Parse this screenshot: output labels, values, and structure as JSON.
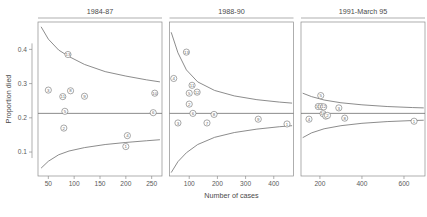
{
  "figure": {
    "xlabel": "Number of cases",
    "ylabel": "Proportion died"
  },
  "chart_data": {
    "type": "scatter",
    "title": "",
    "xlabel": "Number of cases",
    "ylabel": "Proportion died",
    "grid": false,
    "legend": "none",
    "reference_line": 0.213,
    "ylim": [
      0.03,
      0.48
    ],
    "yticks": [
      0.1,
      0.2,
      0.3,
      0.4
    ],
    "ytick_labels": [
      "0.1",
      "0.2",
      "0.3",
      "0.4"
    ],
    "panels": [
      {
        "title": "1984-87",
        "xlim": [
          30,
          270
        ],
        "xticks": [
          50,
          100,
          150,
          200,
          250
        ],
        "xtick_labels": [
          "50",
          "100",
          "150",
          "200",
          "250"
        ],
        "points": [
          {
            "label": "13",
            "x": 88,
            "y": 0.385
          },
          {
            "label": "3",
            "x": 50,
            "y": 0.281
          },
          {
            "label": "8",
            "x": 93,
            "y": 0.279
          },
          {
            "label": "11",
            "x": 78,
            "y": 0.262
          },
          {
            "label": "9",
            "x": 120,
            "y": 0.263
          },
          {
            "label": "5",
            "x": 82,
            "y": 0.219
          },
          {
            "label": "6",
            "x": 253,
            "y": 0.215
          },
          {
            "label": "10",
            "x": 256,
            "y": 0.272
          },
          {
            "label": "2",
            "x": 80,
            "y": 0.17
          },
          {
            "label": "4",
            "x": 203,
            "y": 0.148
          },
          {
            "label": "1",
            "x": 200,
            "y": 0.116
          }
        ],
        "upper_curve": [
          {
            "x": 36,
            "y": 0.466
          },
          {
            "x": 50,
            "y": 0.43
          },
          {
            "x": 70,
            "y": 0.398
          },
          {
            "x": 90,
            "y": 0.379
          },
          {
            "x": 120,
            "y": 0.356
          },
          {
            "x": 160,
            "y": 0.335
          },
          {
            "x": 200,
            "y": 0.322
          },
          {
            "x": 240,
            "y": 0.311
          },
          {
            "x": 266,
            "y": 0.305
          }
        ],
        "lower_curve": [
          {
            "x": 36,
            "y": 0.053
          },
          {
            "x": 50,
            "y": 0.073
          },
          {
            "x": 70,
            "y": 0.092
          },
          {
            "x": 90,
            "y": 0.103
          },
          {
            "x": 120,
            "y": 0.113
          },
          {
            "x": 160,
            "y": 0.122
          },
          {
            "x": 200,
            "y": 0.128
          },
          {
            "x": 240,
            "y": 0.133
          },
          {
            "x": 266,
            "y": 0.136
          }
        ]
      },
      {
        "title": "1988-90",
        "xlim": [
          30,
          470
        ],
        "xticks": [
          100,
          200,
          300,
          400
        ],
        "xtick_labels": [
          "100",
          "200",
          "300",
          "400"
        ],
        "points": [
          {
            "label": "13",
            "x": 90,
            "y": 0.392
          },
          {
            "label": "4",
            "x": 45,
            "y": 0.315
          },
          {
            "label": "11",
            "x": 110,
            "y": 0.295
          },
          {
            "label": "5",
            "x": 100,
            "y": 0.272
          },
          {
            "label": "12",
            "x": 128,
            "y": 0.275
          },
          {
            "label": "2",
            "x": 100,
            "y": 0.24
          },
          {
            "label": "6",
            "x": 113,
            "y": 0.213
          },
          {
            "label": "8",
            "x": 188,
            "y": 0.21
          },
          {
            "label": "9",
            "x": 345,
            "y": 0.196
          },
          {
            "label": "3",
            "x": 60,
            "y": 0.185
          },
          {
            "label": "7",
            "x": 163,
            "y": 0.185
          },
          {
            "label": "1",
            "x": 447,
            "y": 0.182
          }
        ],
        "upper_curve": [
          {
            "x": 36,
            "y": 0.45
          },
          {
            "x": 60,
            "y": 0.39
          },
          {
            "x": 90,
            "y": 0.34
          },
          {
            "x": 130,
            "y": 0.305
          },
          {
            "x": 190,
            "y": 0.28
          },
          {
            "x": 260,
            "y": 0.264
          },
          {
            "x": 340,
            "y": 0.253
          },
          {
            "x": 420,
            "y": 0.246
          },
          {
            "x": 465,
            "y": 0.243
          }
        ],
        "lower_curve": [
          {
            "x": 36,
            "y": 0.04
          },
          {
            "x": 60,
            "y": 0.072
          },
          {
            "x": 90,
            "y": 0.098
          },
          {
            "x": 130,
            "y": 0.122
          },
          {
            "x": 190,
            "y": 0.143
          },
          {
            "x": 260,
            "y": 0.157
          },
          {
            "x": 340,
            "y": 0.167
          },
          {
            "x": 420,
            "y": 0.174
          },
          {
            "x": 465,
            "y": 0.177
          }
        ]
      },
      {
        "title": "1991-March 95",
        "xlim": [
          110,
          700
        ],
        "xticks": [
          200,
          400,
          600
        ],
        "xtick_labels": [
          "200",
          "400",
          "600"
        ],
        "points": [
          {
            "label": "5",
            "x": 204,
            "y": 0.265
          },
          {
            "label": "13",
            "x": 192,
            "y": 0.233
          },
          {
            "label": "11",
            "x": 206,
            "y": 0.233
          },
          {
            "label": "12",
            "x": 218,
            "y": 0.232
          },
          {
            "label": "3",
            "x": 290,
            "y": 0.229
          },
          {
            "label": "10",
            "x": 215,
            "y": 0.212
          },
          {
            "label": "7",
            "x": 228,
            "y": 0.205
          },
          {
            "label": "2",
            "x": 236,
            "y": 0.207
          },
          {
            "label": "8",
            "x": 318,
            "y": 0.199
          },
          {
            "label": "4",
            "x": 148,
            "y": 0.196
          },
          {
            "label": "1",
            "x": 648,
            "y": 0.19
          }
        ],
        "upper_curve": [
          {
            "x": 118,
            "y": 0.272
          },
          {
            "x": 160,
            "y": 0.262
          },
          {
            "x": 220,
            "y": 0.252
          },
          {
            "x": 300,
            "y": 0.244
          },
          {
            "x": 400,
            "y": 0.238
          },
          {
            "x": 520,
            "y": 0.233
          },
          {
            "x": 640,
            "y": 0.23
          },
          {
            "x": 694,
            "y": 0.229
          }
        ],
        "lower_curve": [
          {
            "x": 118,
            "y": 0.142
          },
          {
            "x": 160,
            "y": 0.156
          },
          {
            "x": 220,
            "y": 0.168
          },
          {
            "x": 300,
            "y": 0.177
          },
          {
            "x": 400,
            "y": 0.184
          },
          {
            "x": 520,
            "y": 0.189
          },
          {
            "x": 640,
            "y": 0.192
          },
          {
            "x": 694,
            "y": 0.193
          }
        ]
      }
    ]
  }
}
